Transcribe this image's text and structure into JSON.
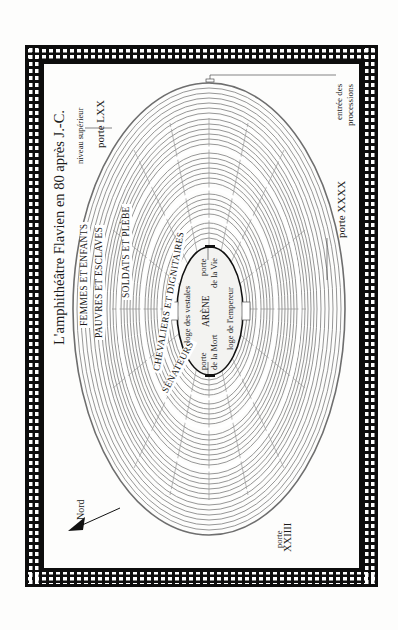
{
  "title": "L'amphithéâtre Flavien en 80 après J.-C.",
  "compass": {
    "label": "Nord",
    "icon": "north-arrow-icon"
  },
  "zones": [
    {
      "id": "femmes",
      "label": "FEMMES ET ENFANTS"
    },
    {
      "id": "pauvres",
      "label": "PAUVRES ET ESCLAVES"
    },
    {
      "id": "soldats",
      "label": "SOLDATS ET PLÈBE"
    },
    {
      "id": "chevaliers",
      "label": "CHEVALIERS ET DIGNITAIRES"
    },
    {
      "id": "senateurs",
      "label": "SÉNATEURS"
    }
  ],
  "arena": {
    "label": "ARÈNE",
    "loge_vestales": "loge des vestales",
    "loge_empereur": "loge de l'empereur",
    "porte_mort": [
      "porte",
      "de la Mort"
    ],
    "porte_vie": [
      "porte",
      "de la Vie"
    ]
  },
  "annotations": {
    "niveau_superieur": "niveau supérieur",
    "porte_lxx": "porte LXX",
    "entree_processions": [
      "entrée des",
      "processions"
    ],
    "porte_xxxx": "porte XXXX",
    "porte_xxiiii": [
      "porte",
      "XXIIII"
    ]
  },
  "colors": {
    "frame": "#0d0d0d",
    "seating_lines": "#8a8a8a",
    "aisle_gap": "#ffffff",
    "arena_fill": "#f3f3f1",
    "background": "#fdfdfc"
  }
}
